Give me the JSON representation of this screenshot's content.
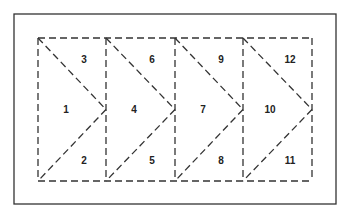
{
  "diagram": {
    "frame": {
      "x": 14,
      "y": 14,
      "w": 322,
      "h": 190
    },
    "grid": {
      "left": 38,
      "top": 38,
      "bottom": 181,
      "columns": [
        38,
        106,
        175,
        243,
        312
      ]
    },
    "line_color": "#333333",
    "triangle_labels": [
      {
        "id": "1",
        "x": 66,
        "y": 113
      },
      {
        "id": "2",
        "x": 84,
        "y": 164
      },
      {
        "id": "3",
        "x": 84,
        "y": 63
      },
      {
        "id": "4",
        "x": 134,
        "y": 113
      },
      {
        "id": "5",
        "x": 152,
        "y": 164
      },
      {
        "id": "6",
        "x": 152,
        "y": 63
      },
      {
        "id": "7",
        "x": 203,
        "y": 113
      },
      {
        "id": "8",
        "x": 221,
        "y": 164
      },
      {
        "id": "9",
        "x": 221,
        "y": 63
      },
      {
        "id": "10",
        "x": 270,
        "y": 113
      },
      {
        "id": "11",
        "x": 290,
        "y": 164
      },
      {
        "id": "12",
        "x": 290,
        "y": 63
      }
    ]
  }
}
